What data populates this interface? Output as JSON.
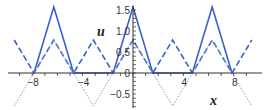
{
  "chart_data": {
    "type": "line",
    "title": "",
    "xlabel": "x",
    "ylabel": "u",
    "xlim": [
      -9.5,
      9.5
    ],
    "ylim": [
      -0.8,
      1.6
    ],
    "x_ticks": [
      -8,
      -4,
      0,
      4,
      8
    ],
    "y_ticks": [
      -0.5,
      0,
      0.5,
      1.0,
      1.5
    ],
    "x_tick_labels": [
      "-8",
      "-4",
      "0",
      "4",
      "8"
    ],
    "y_tick_labels": [
      "-0.5",
      "0",
      "0.5",
      "1.0",
      "1.5"
    ],
    "grid": false,
    "legend": null,
    "series": [
      {
        "name": "solid",
        "style": "solid",
        "color": "#3a5fcd",
        "x": [
          -7.854,
          -6.283,
          -4.712,
          -1.571,
          0,
          1.571,
          4.712,
          6.283,
          7.854
        ],
        "y": [
          0,
          1.571,
          0,
          0,
          1.571,
          0,
          0,
          1.571,
          0
        ]
      },
      {
        "name": "dashed",
        "style": "dashed",
        "color": "#3a5fcd",
        "x": [
          -9.425,
          -7.854,
          -6.283,
          -4.712,
          -3.142,
          -1.571,
          0,
          1.571,
          3.142,
          4.712,
          6.283,
          7.854,
          9.425
        ],
        "y": [
          0.785,
          0,
          0.785,
          0,
          0.785,
          0,
          0.785,
          0,
          0.785,
          0,
          0.785,
          0,
          0.785
        ]
      },
      {
        "name": "dotted",
        "style": "dotted",
        "color": "#8a9ad8",
        "x": [
          -9.425,
          -7.854,
          -6.283,
          -4.712,
          -3.142,
          -1.571,
          0,
          1.571,
          3.142,
          4.712,
          6.283,
          7.854,
          9.425
        ],
        "y": [
          -0.785,
          0,
          0.785,
          0,
          -0.785,
          0,
          0.785,
          0,
          -0.785,
          0,
          0.785,
          0,
          -0.785
        ]
      }
    ]
  }
}
